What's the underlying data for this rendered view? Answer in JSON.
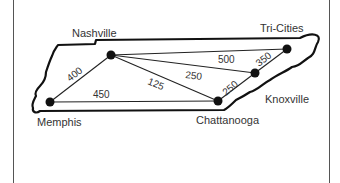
{
  "diagram": {
    "type": "weighted-graph-map",
    "region": "Tennessee",
    "cities": [
      {
        "id": "nashville",
        "label": "Nashville",
        "x": 111,
        "y": 55
      },
      {
        "id": "memphis",
        "label": "Memphis",
        "x": 50,
        "y": 102
      },
      {
        "id": "chattanooga",
        "label": "Chattanooga",
        "x": 218,
        "y": 101
      },
      {
        "id": "knoxville",
        "label": "Knoxville",
        "x": 255,
        "y": 73
      },
      {
        "id": "tri-cities",
        "label": "Tri-Cities",
        "x": 287,
        "y": 49
      }
    ],
    "edges": [
      {
        "from": "memphis",
        "to": "nashville",
        "weight": "400"
      },
      {
        "from": "memphis",
        "to": "chattanooga",
        "weight": "450"
      },
      {
        "from": "nashville",
        "to": "chattanooga",
        "weight": "125"
      },
      {
        "from": "nashville",
        "to": "knoxville",
        "weight": "250"
      },
      {
        "from": "nashville",
        "to": "tri-cities",
        "weight": "500"
      },
      {
        "from": "chattanooga",
        "to": "knoxville",
        "weight": "250"
      },
      {
        "from": "knoxville",
        "to": "tri-cities",
        "weight": "350"
      }
    ]
  },
  "labels": {
    "nashville": "Nashville",
    "memphis": "Memphis",
    "chattanooga": "Chattanooga",
    "knoxville": "Knoxville",
    "tri_cities": "Tri-Cities",
    "w_memphis_nashville": "400",
    "w_memphis_chattanooga": "450",
    "w_nashville_chattanooga": "125",
    "w_nashville_knoxville": "250",
    "w_nashville_tricities": "500",
    "w_chattanooga_knoxville": "250",
    "w_knoxville_tricities": "350"
  },
  "colors": {
    "line": "#222222",
    "outline": "#111111",
    "text": "#333333",
    "background": "#ffffff"
  }
}
